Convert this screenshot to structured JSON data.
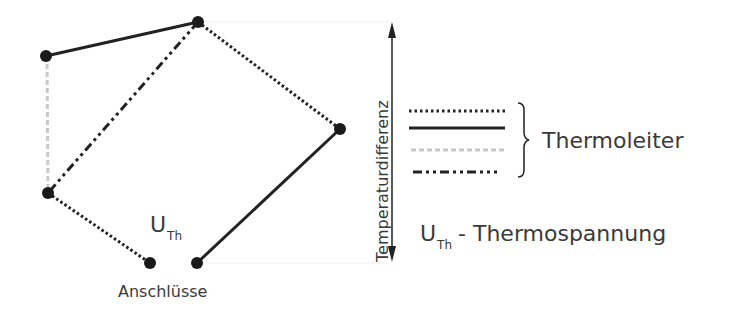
{
  "diagram": {
    "nodes": [
      {
        "id": "A",
        "x": 46,
        "y": 56
      },
      {
        "id": "B",
        "x": 198,
        "y": 22
      },
      {
        "id": "C",
        "x": 340,
        "y": 129
      },
      {
        "id": "D",
        "x": 48,
        "y": 193
      },
      {
        "id": "E",
        "x": 150,
        "y": 263
      },
      {
        "id": "F",
        "x": 197,
        "y": 263
      }
    ],
    "edges": [
      {
        "from": "A",
        "to": "B",
        "style": "solid"
      },
      {
        "from": "A",
        "to": "D",
        "style": "dashed-gray"
      },
      {
        "from": "B",
        "to": "D",
        "style": "dash-dot"
      },
      {
        "from": "B",
        "to": "C",
        "style": "dotted"
      },
      {
        "from": "D",
        "to": "E",
        "style": "dotted"
      },
      {
        "from": "C",
        "to": "F",
        "style": "solid"
      }
    ],
    "voltage_label": {
      "main": "U",
      "sub": "Th"
    },
    "terminals_label": "Anschlüsse",
    "axis_label": "Temperaturdifferenz"
  },
  "legend": {
    "line_styles": [
      "dotted",
      "solid",
      "dashed-gray",
      "dash-dot"
    ],
    "group_label": "Thermoleiter",
    "voltage": {
      "main": "U",
      "sub": "Th",
      "description": "- Thermospannung"
    }
  }
}
